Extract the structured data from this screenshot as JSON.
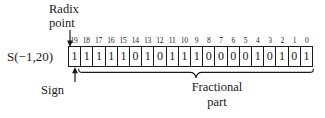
{
  "figure": {
    "type_label": "S(−1,20)",
    "radix_annotation": {
      "line1": "Radix",
      "line2": "point"
    },
    "sign_annotation": "Sign",
    "fractional_annotation": {
      "line1": "Fractional",
      "line2": "part"
    },
    "bit_indices": [
      "19",
      "18",
      "17",
      "16",
      "15",
      "14",
      "13",
      "12",
      "11",
      "10",
      "9",
      "8",
      "7",
      "6",
      "5",
      "4",
      "3",
      "2",
      "1",
      "0"
    ],
    "bits": [
      "1",
      "1",
      "1",
      "1",
      "1",
      "0",
      "1",
      "0",
      "1",
      "1",
      "1",
      "0",
      "0",
      "0",
      "0",
      "1",
      "0",
      "1",
      "0",
      "1"
    ],
    "colors": {
      "ink": "#1a1a1a",
      "background": "#ffffff"
    }
  }
}
